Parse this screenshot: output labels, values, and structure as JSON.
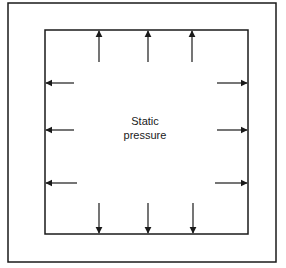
{
  "diagram": {
    "label_line1": "Static",
    "label_line2": "pressure",
    "stroke_color": "#1a1a1a",
    "outer_frame": {
      "x": 8,
      "y": 3,
      "w": 268,
      "h": 259
    },
    "inner_square": {
      "x": 45,
      "y": 30,
      "w": 203,
      "h": 204
    },
    "arrows": {
      "top": [
        99,
        148,
        192
      ],
      "bottom": [
        99,
        148,
        193
      ],
      "left": [
        83,
        130,
        183
      ],
      "right": [
        83,
        130,
        183
      ]
    }
  }
}
